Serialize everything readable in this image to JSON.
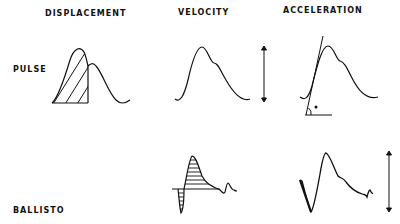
{
  "columns": [
    {
      "id": "displacement",
      "label": "DISPLACEMENT"
    },
    {
      "id": "velocity",
      "label": "VELOCITY"
    },
    {
      "id": "acceleration",
      "label": "ACCELERATION"
    }
  ],
  "rows": [
    {
      "id": "pulse",
      "label": "PULSE"
    },
    {
      "id": "ballisto",
      "label": "BALLISTO"
    }
  ],
  "panels": {
    "pulse_displacement": {
      "description": "Pulse waveform with hatched area under upstroke"
    },
    "pulse_velocity": {
      "description": "Pulse velocity waveform with amplitude arrow"
    },
    "pulse_acceleration": {
      "description": "Pulse acceleration waveform with tangent line and angle marker"
    },
    "ballisto_velocity": {
      "description": "Ballistocardiogram waveform with horizontally hatched areas"
    },
    "ballisto_acceleration": {
      "description": "Ballistocardiogram acceleration waveform with amplitude arrow"
    }
  },
  "colors": {
    "ink": "#111111",
    "background": "#ffffff"
  }
}
